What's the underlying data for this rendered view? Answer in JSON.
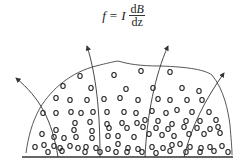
{
  "formula": {
    "lhs": "f",
    "eq": "=",
    "coef": "I",
    "numerator_d": "d",
    "numerator_var": "B",
    "denominator": "dz"
  },
  "diagram": {
    "stroke": "#333333",
    "baseline": {
      "x1": 22,
      "x2": 233,
      "y": 157
    },
    "outline_path": "M26,153 C28,138 32,122 40,108 C52,88 72,72 96,66 C108,63 112,62 118,61 C128,64 140,66 160,66 C190,67 205,70 212,75 C224,90 228,110 230,125 C231,138 232,148 232,155",
    "field_lines": [
      {
        "name": "field-line-1",
        "d": "M58,157 C52,120 40,98 16,78",
        "tip": [
          16,
          78
        ],
        "angle": -140
      },
      {
        "name": "field-line-2",
        "d": "M100,157 C100,110 96,75 87,46",
        "tip": [
          87,
          46
        ],
        "angle": -107
      },
      {
        "name": "field-line-3",
        "d": "M145,157 C147,115 155,75 168,46",
        "tip": [
          168,
          46
        ],
        "angle": -66
      },
      {
        "name": "field-line-4",
        "d": "M184,157 C192,125 205,100 224,73",
        "tip": [
          224,
          73
        ],
        "angle": -55
      }
    ],
    "particles": [
      [
        80,
        76
      ],
      [
        114,
        75
      ],
      [
        141,
        71
      ],
      [
        170,
        72
      ],
      [
        63,
        86
      ],
      [
        91,
        88
      ],
      [
        126,
        89
      ],
      [
        153,
        88
      ],
      [
        182,
        88
      ],
      [
        199,
        91
      ],
      [
        56,
        98
      ],
      [
        70,
        100
      ],
      [
        87,
        100
      ],
      [
        104,
        99
      ],
      [
        120,
        98
      ],
      [
        138,
        100
      ],
      [
        158,
        99
      ],
      [
        170,
        100
      ],
      [
        187,
        100
      ],
      [
        202,
        100
      ],
      [
        43,
        113
      ],
      [
        56,
        113
      ],
      [
        71,
        112
      ],
      [
        81,
        113
      ],
      [
        93,
        112
      ],
      [
        107,
        112
      ],
      [
        124,
        112
      ],
      [
        136,
        113
      ],
      [
        152,
        111
      ],
      [
        166,
        113
      ],
      [
        177,
        110
      ],
      [
        192,
        112
      ],
      [
        209,
        112
      ],
      [
        75,
        123
      ],
      [
        90,
        122
      ],
      [
        107,
        124
      ],
      [
        122,
        123
      ],
      [
        137,
        123
      ],
      [
        145,
        120
      ],
      [
        158,
        121
      ],
      [
        172,
        124
      ],
      [
        186,
        121
      ],
      [
        200,
        121
      ],
      [
        216,
        120
      ],
      [
        42,
        134
      ],
      [
        56,
        130
      ],
      [
        74,
        130
      ],
      [
        92,
        131
      ],
      [
        109,
        128
      ],
      [
        127,
        128
      ],
      [
        143,
        127
      ],
      [
        156,
        128
      ],
      [
        168,
        129
      ],
      [
        184,
        127
      ],
      [
        197,
        128
      ],
      [
        210,
        129
      ],
      [
        218,
        127
      ],
      [
        54,
        137
      ],
      [
        64,
        138
      ],
      [
        76,
        137
      ],
      [
        92,
        138
      ],
      [
        108,
        136
      ],
      [
        118,
        136
      ],
      [
        134,
        137
      ],
      [
        149,
        134
      ],
      [
        162,
        135
      ],
      [
        174,
        136
      ],
      [
        189,
        134
      ],
      [
        204,
        134
      ],
      [
        220,
        133
      ],
      [
        35,
        147
      ],
      [
        44,
        145
      ],
      [
        54,
        146
      ],
      [
        60,
        148
      ],
      [
        70,
        146
      ],
      [
        78,
        148
      ],
      [
        86,
        147
      ],
      [
        96,
        148
      ],
      [
        108,
        149
      ],
      [
        118,
        144
      ],
      [
        128,
        148
      ],
      [
        138,
        149
      ],
      [
        152,
        147
      ],
      [
        163,
        148
      ],
      [
        172,
        145
      ],
      [
        180,
        144
      ],
      [
        190,
        147
      ],
      [
        201,
        148
      ],
      [
        210,
        147
      ],
      [
        222,
        146
      ],
      [
        48,
        152
      ],
      [
        62,
        151
      ],
      [
        85,
        152
      ],
      [
        100,
        152
      ],
      [
        116,
        152
      ],
      [
        127,
        152
      ],
      [
        142,
        152
      ],
      [
        156,
        153
      ],
      [
        170,
        151
      ],
      [
        186,
        152
      ],
      [
        200,
        152
      ],
      [
        214,
        151
      ],
      [
        228,
        152
      ]
    ]
  }
}
